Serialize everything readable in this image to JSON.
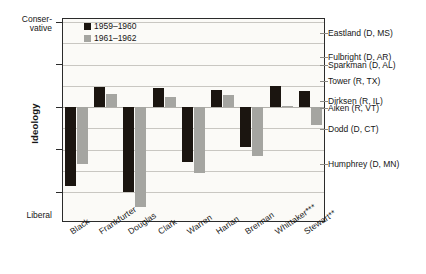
{
  "chart_data": {
    "type": "bar",
    "title": "",
    "xlabel": "",
    "ylabel": "Ideology",
    "ylim": [
      -2.5,
      2.2
    ],
    "grid": true,
    "legend_position": "top-left-inside",
    "axis_pole_top": "Conser-\nvative",
    "axis_pole_top_line1": "Conser-",
    "axis_pole_top_line2": "vative",
    "axis_pole_bottom": "Liberal",
    "yticks": [
      "2",
      "1",
      "0",
      "-1",
      "-2"
    ],
    "ytick_values": [
      2,
      1,
      0,
      -1,
      -2
    ],
    "categories": [
      "Black",
      "Frankfurter",
      "Douglas",
      "Clark",
      "Warren",
      "Harlan",
      "Brennan",
      "Whittaker***",
      "Stewart**"
    ],
    "series": [
      {
        "name": "1959–1960",
        "color": "#1b1510",
        "values": [
          -1.85,
          0.48,
          -2.0,
          0.45,
          -1.3,
          0.4,
          -0.95,
          0.5,
          0.37
        ]
      },
      {
        "name": "1961–1962",
        "color": "#a5a5a1",
        "values": [
          -1.35,
          0.3,
          -2.35,
          0.23,
          -1.55,
          0.28,
          -1.15,
          0.02,
          -0.42
        ]
      }
    ],
    "annotations": [
      {
        "label": "Eastland (D, MS)",
        "value": 1.75
      },
      {
        "label": "Fulbright (D, AR)",
        "value": 1.18
      },
      {
        "label": "Sparkman (D, AL)",
        "value": 1.0
      },
      {
        "label": "Tower (R, TX)",
        "value": 0.62
      },
      {
        "label": "Dirksen (R, IL)",
        "value": 0.15
      },
      {
        "label": "Aiken (R, VT)",
        "value": -0.02
      },
      {
        "label": "Dodd (D, CT)",
        "value": -0.52
      },
      {
        "label": "Humphrey (D, MN)",
        "value": -1.35
      }
    ]
  },
  "legend": {
    "items": [
      {
        "label": "1959–1960"
      },
      {
        "label": "1961–1962"
      }
    ]
  }
}
